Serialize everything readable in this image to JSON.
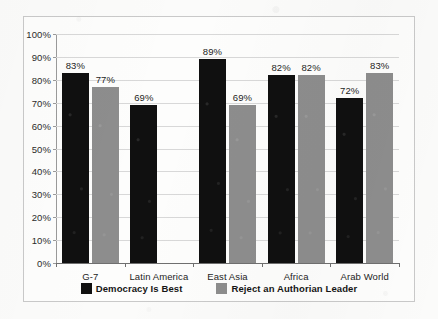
{
  "chart_data": {
    "type": "bar",
    "title": "",
    "subtitle": "",
    "xlabel": "",
    "ylabel": "",
    "ylim": [
      0,
      100
    ],
    "y_tick_labels": [
      "0%",
      "10%",
      "20%",
      "30%",
      "40%",
      "50%",
      "60%",
      "70%",
      "80%",
      "90%",
      "100%"
    ],
    "y_tick_values": [
      0,
      10,
      20,
      30,
      40,
      50,
      60,
      70,
      80,
      90,
      100
    ],
    "grid": "horizontal",
    "legend_position": "bottom",
    "categories": [
      "G-7",
      "Latin America",
      "East Asia",
      "Africa",
      "Arab World"
    ],
    "series": [
      {
        "name": "Democracy Is Best",
        "color": "#101010",
        "values": [
          83,
          69,
          89,
          82,
          72
        ],
        "labels": [
          "83%",
          "69%",
          "89%",
          "82%",
          "72%"
        ]
      },
      {
        "name": "Reject an Authorian Leader",
        "color": "#8d8d8d",
        "values": [
          77,
          null,
          69,
          82,
          83
        ],
        "labels": [
          "77%",
          "",
          "69%",
          "82%",
          "83%"
        ]
      }
    ]
  }
}
